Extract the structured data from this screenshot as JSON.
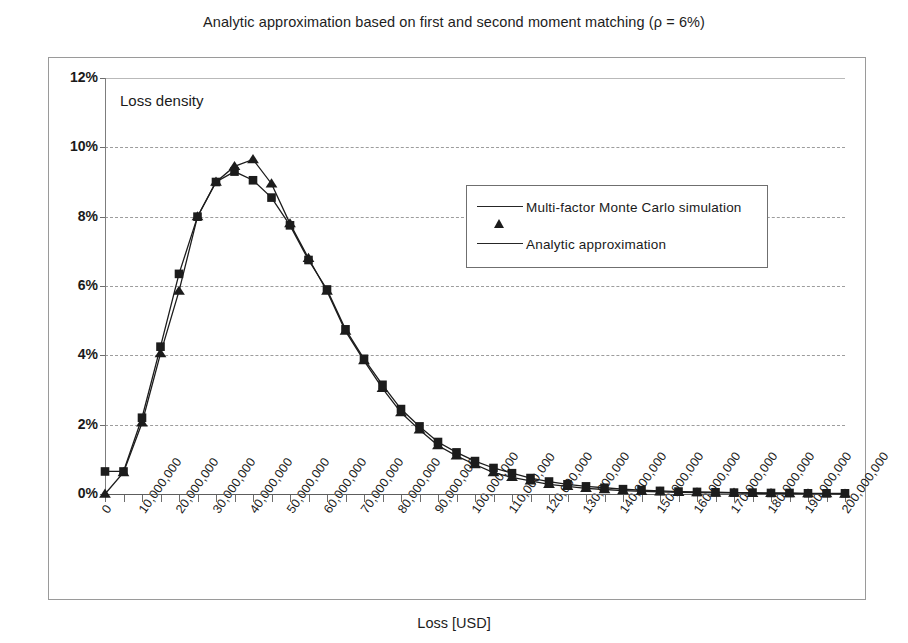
{
  "chart_data": {
    "type": "line",
    "title": "Analytic approximation based on first and second moment matching (ρ = 6%)",
    "xlabel": "Loss [USD]",
    "ylabel": "Loss density",
    "plot_annotation": "Loss density",
    "grid": true,
    "legend_position": "inside-upper-right",
    "xlim": [
      0,
      200000000
    ],
    "ylim": [
      0,
      12
    ],
    "y_tick_labels": [
      "0%",
      "2%",
      "4%",
      "6%",
      "8%",
      "10%",
      "12%"
    ],
    "y_tick_values": [
      0,
      2,
      4,
      6,
      8,
      10,
      12
    ],
    "x_tick_labels": [
      "0",
      "10,000,000",
      "20,000,000",
      "30,000,000",
      "40,000,000",
      "50,000,000",
      "60,000,000",
      "70,000,000",
      "80,000,000",
      "90,000,000",
      "100,000,000",
      "110,000,000",
      "120,000,000",
      "130,000,000",
      "140,000,000",
      "150,000,000",
      "160,000,000",
      "170,000,000",
      "180,000,000",
      "190,000,000",
      "200,000,000"
    ],
    "x_tick_values": [
      0,
      10000000,
      20000000,
      30000000,
      40000000,
      50000000,
      60000000,
      70000000,
      80000000,
      90000000,
      100000000,
      110000000,
      120000000,
      130000000,
      140000000,
      150000000,
      160000000,
      170000000,
      180000000,
      190000000,
      200000000
    ],
    "x": [
      0,
      5000000,
      10000000,
      15000000,
      20000000,
      25000000,
      30000000,
      35000000,
      40000000,
      45000000,
      50000000,
      55000000,
      60000000,
      65000000,
      70000000,
      75000000,
      80000000,
      85000000,
      90000000,
      95000000,
      100000000,
      105000000,
      110000000,
      115000000,
      120000000,
      125000000,
      130000000,
      135000000,
      140000000,
      145000000,
      150000000,
      155000000,
      160000000,
      165000000,
      170000000,
      175000000,
      180000000,
      185000000,
      190000000,
      195000000,
      200000000
    ],
    "series": [
      {
        "name": "Multi-factor Monte Carlo simulation",
        "marker": "triangle",
        "color": "#1c1c1c",
        "values": [
          0.0,
          0.62,
          2.05,
          4.05,
          5.85,
          8.0,
          9.0,
          9.45,
          9.65,
          8.95,
          7.8,
          6.8,
          5.85,
          4.7,
          3.85,
          3.05,
          2.35,
          1.85,
          1.4,
          1.1,
          0.85,
          0.62,
          0.48,
          0.38,
          0.28,
          0.22,
          0.16,
          0.13,
          0.1,
          0.08,
          0.06,
          0.05,
          0.04,
          0.03,
          0.03,
          0.02,
          0.02,
          0.01,
          0.01,
          0.01,
          0.0
        ]
      },
      {
        "name": "Analytic approximation",
        "marker": "square",
        "color": "#1c1c1c",
        "values": [
          0.65,
          0.65,
          2.2,
          4.25,
          6.35,
          8.0,
          9.0,
          9.3,
          9.05,
          8.55,
          7.75,
          6.75,
          5.9,
          4.75,
          3.9,
          3.15,
          2.45,
          1.95,
          1.5,
          1.2,
          0.95,
          0.75,
          0.6,
          0.46,
          0.36,
          0.28,
          0.22,
          0.18,
          0.14,
          0.11,
          0.09,
          0.07,
          0.06,
          0.05,
          0.04,
          0.04,
          0.03,
          0.03,
          0.02,
          0.02,
          0.02
        ]
      }
    ]
  }
}
